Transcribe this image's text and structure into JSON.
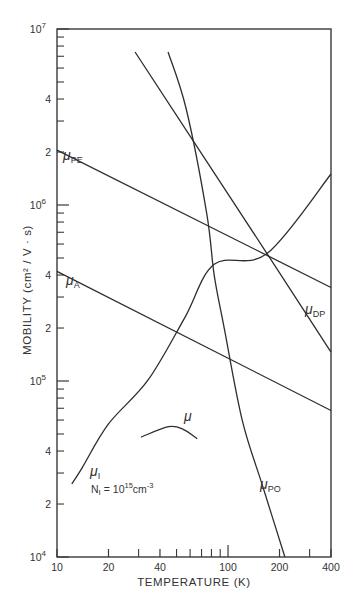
{
  "chart_data": {
    "type": "line",
    "title": "",
    "xlabel": "TEMPERATURE (K)",
    "ylabel": "MOBILITY  (cm² / V · s)",
    "xscale": "log",
    "yscale": "log",
    "xlim": [
      10,
      400
    ],
    "ylim": [
      10000,
      10000000
    ],
    "grid": false,
    "legend": "inline labels",
    "x_ticks": [
      {
        "value": 10,
        "label": "10"
      },
      {
        "value": 20,
        "label": "20"
      },
      {
        "value": 40,
        "label": "40"
      },
      {
        "value": 100,
        "label": "100"
      },
      {
        "value": 200,
        "label": "200"
      },
      {
        "value": 400,
        "label": "400"
      }
    ],
    "x_minor_ticks": [
      30,
      50,
      60,
      70,
      80,
      90,
      300
    ],
    "y_ticks": [
      {
        "value": 10000,
        "label": "10",
        "exp": "4"
      },
      {
        "value": 20000,
        "label": "2"
      },
      {
        "value": 40000,
        "label": "4"
      },
      {
        "value": 100000,
        "label": "10",
        "exp": "5"
      },
      {
        "value": 200000,
        "label": "2"
      },
      {
        "value": 400000,
        "label": "4"
      },
      {
        "value": 1000000,
        "label": "10",
        "exp": "6"
      },
      {
        "value": 2000000,
        "label": "2"
      },
      {
        "value": 4000000,
        "label": "4"
      },
      {
        "value": 10000000,
        "label": "10",
        "exp": "7"
      }
    ],
    "series": [
      {
        "name": "μ_PE",
        "label": "μ",
        "sub": "PE",
        "points": [
          [
            10,
            2050000
          ],
          [
            400,
            340000
          ]
        ],
        "label_at": [
          63,
          160
        ]
      },
      {
        "name": "μ_A",
        "label": "μ",
        "sub": "A",
        "points": [
          [
            10,
            420000
          ],
          [
            400,
            68000
          ]
        ],
        "label_at": [
          66,
          285
        ]
      },
      {
        "name": "μ_DP",
        "label": "μ",
        "sub": "DP",
        "points": [
          [
            28.6,
            7400000
          ],
          [
            169,
            530000
          ],
          [
            400,
            146000
          ]
        ],
        "label_at": [
          305,
          314
        ]
      },
      {
        "name": "μ_PO",
        "label": "μ",
        "sub": "PO",
        "points": [
          [
            44.6,
            7400000
          ],
          [
            57,
            3500000
          ],
          [
            75,
            900000
          ],
          [
            83,
            400000
          ],
          [
            95,
            200000
          ],
          [
            121,
            60000
          ],
          [
            160,
            25000
          ],
          [
            215,
            10000
          ]
        ],
        "label_at": [
          260,
          489
        ]
      },
      {
        "name": "μ_I",
        "label": "μ",
        "sub": "I",
        "note": "N_I = 10^15 cm^-3",
        "points": [
          [
            12.2,
            26000
          ],
          [
            14,
            32000
          ],
          [
            20,
            57000
          ],
          [
            34,
            101000
          ],
          [
            56,
            230000
          ],
          [
            83,
            460000
          ],
          [
            169,
            530000
          ],
          [
            400,
            1500000
          ]
        ],
        "label_at": [
          90,
          476
        ]
      },
      {
        "name": "μ",
        "label": "μ",
        "sub": "",
        "points": [
          [
            31,
            48000
          ],
          [
            45,
            55000
          ],
          [
            55,
            53000
          ],
          [
            66,
            47000
          ]
        ],
        "label_at": [
          184,
          421
        ]
      }
    ],
    "annotations": [
      {
        "text": "N",
        "sub": "I",
        "rest": " = 10",
        "sup": "15",
        "unit": "cm",
        "unit_sup": "-3",
        "at": [
          91,
          493
        ]
      }
    ]
  }
}
